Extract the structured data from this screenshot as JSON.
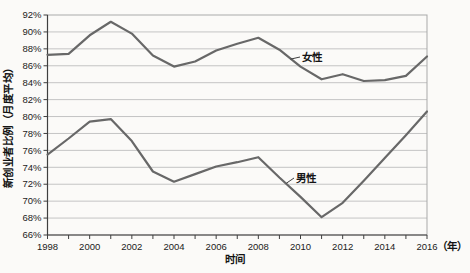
{
  "chart_data": {
    "type": "line",
    "title": "",
    "xlabel": "时间",
    "ylabel": "新创业者比例（月度平均）",
    "x_unit_label": "（年）",
    "x": [
      1998,
      1999,
      2000,
      2001,
      2002,
      2003,
      2004,
      2005,
      2006,
      2007,
      2008,
      2009,
      2010,
      2011,
      2012,
      2013,
      2014,
      2015,
      2016
    ],
    "series": [
      {
        "name": "女性",
        "values": [
          87.3,
          87.4,
          89.6,
          91.2,
          89.8,
          87.2,
          85.9,
          86.5,
          87.8,
          88.6,
          89.3,
          87.9,
          85.9,
          84.4,
          85.0,
          84.2,
          84.3,
          84.8,
          87.1
        ]
      },
      {
        "name": "男性",
        "values": [
          75.5,
          77.4,
          79.4,
          79.7,
          77.1,
          73.5,
          72.3,
          73.2,
          74.1,
          74.6,
          75.2,
          72.8,
          70.5,
          68.1,
          69.8,
          72.4,
          75.1,
          77.8,
          80.6
        ]
      }
    ],
    "ylim": [
      66,
      92
    ],
    "ytick_step": 2,
    "yticks": [
      "66%",
      "68%",
      "70%",
      "72%",
      "74%",
      "76%",
      "78%",
      "80%",
      "82%",
      "84%",
      "86%",
      "88%",
      "90%",
      "92%"
    ],
    "xticks": [
      "1998",
      "2000",
      "2002",
      "2004",
      "2006",
      "2008",
      "2010",
      "2012",
      "2014",
      "2016"
    ],
    "grid": "horizontal",
    "legend_position": "inline-annotations",
    "colors": {
      "line": "#686868",
      "grid": "#c4c4c4",
      "box_border": "#a9a9a9",
      "axis": "#3f3f3f",
      "text": "#1b1b1b",
      "background": "#fbfaf8"
    }
  }
}
